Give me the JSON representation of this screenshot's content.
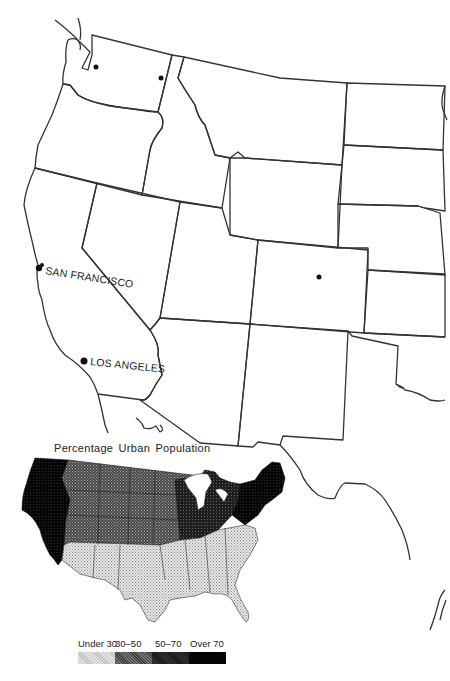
{
  "map": {
    "cities": [
      {
        "name": "Seattle",
        "label": "",
        "x": 96,
        "y": 67
      },
      {
        "name": "Spokane",
        "label": "",
        "x": 161,
        "y": 78
      },
      {
        "name": "Denver",
        "label": "",
        "x": 319,
        "y": 277
      },
      {
        "name": "San Francisco",
        "label": "SAN FRANCISCO",
        "x": 39,
        "y": 268
      },
      {
        "name": "Los Angeles",
        "label": "LOS ANGELES",
        "x": 84,
        "y": 361
      }
    ]
  },
  "inset": {
    "title": "Percentage Urban Population",
    "colors": {
      "under_30": "#c8c8c8",
      "30_50": "#5a5a5a",
      "50_70": "#2a2a2a",
      "over_70": "#0a0a0a"
    }
  },
  "legend": {
    "items": [
      {
        "label": "Under 30",
        "color": "#cfcfcf"
      },
      {
        "label": "30–50",
        "color": "#6a6a6a"
      },
      {
        "label": "50–70",
        "color": "#262626"
      },
      {
        "label": "Over 70",
        "color": "#050505"
      }
    ]
  },
  "caption": {
    "text": "Fig. 4.1   Urban population by state, Western United States, 1960"
  }
}
